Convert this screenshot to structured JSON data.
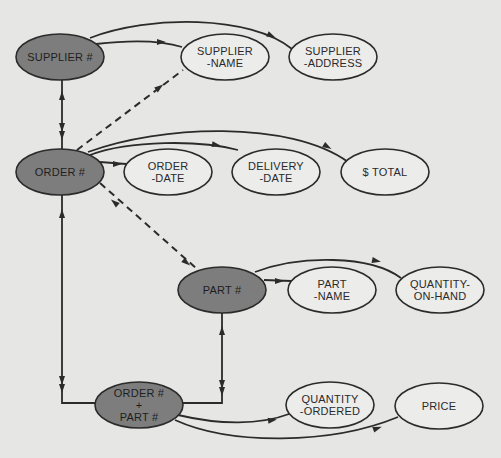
{
  "diagram": {
    "type": "functional-dependency-graph",
    "colors": {
      "background": "#e6e6e4",
      "key_node_fill": "#7d7d7d",
      "attribute_node_fill": "#ececea",
      "stroke": "#2b2b2b"
    },
    "nodes": [
      {
        "id": "supplier_no",
        "kind": "key",
        "lines": [
          "SUPPLIER #"
        ],
        "cx": 60,
        "cy": 57
      },
      {
        "id": "supplier_name",
        "kind": "attribute",
        "lines": [
          "SUPPLIER",
          "-NAME"
        ],
        "cx": 225,
        "cy": 57
      },
      {
        "id": "supplier_address",
        "kind": "attribute",
        "lines": [
          "SUPPLIER",
          "-ADDRESS"
        ],
        "cx": 333,
        "cy": 57
      },
      {
        "id": "order_no",
        "kind": "key",
        "lines": [
          "ORDER #"
        ],
        "cx": 60,
        "cy": 172
      },
      {
        "id": "order_date",
        "kind": "attribute",
        "lines": [
          "ORDER",
          "-DATE"
        ],
        "cx": 168,
        "cy": 172
      },
      {
        "id": "delivery_date",
        "kind": "attribute",
        "lines": [
          "DELIVERY",
          "-DATE"
        ],
        "cx": 276,
        "cy": 172
      },
      {
        "id": "total",
        "kind": "attribute",
        "lines": [
          "$ TOTAL"
        ],
        "cx": 385,
        "cy": 172
      },
      {
        "id": "part_no",
        "kind": "key",
        "lines": [
          "PART #"
        ],
        "cx": 222,
        "cy": 290
      },
      {
        "id": "part_name",
        "kind": "attribute",
        "lines": [
          "PART",
          "-NAME"
        ],
        "cx": 332,
        "cy": 290
      },
      {
        "id": "quantity_on_hand",
        "kind": "attribute",
        "lines": [
          "QUANTITY-",
          "ON-HAND"
        ],
        "cx": 440,
        "cy": 290
      },
      {
        "id": "order_part",
        "kind": "key",
        "lines": [
          "ORDER #",
          "+",
          "PART #"
        ],
        "cx": 139,
        "cy": 405
      },
      {
        "id": "quantity_ordered",
        "kind": "attribute",
        "lines": [
          "QUANTITY",
          "-ORDERED"
        ],
        "cx": 330,
        "cy": 405
      },
      {
        "id": "price",
        "kind": "attribute",
        "lines": [
          "PRICE"
        ],
        "cx": 439,
        "cy": 406
      }
    ],
    "edges": [
      {
        "from": "supplier_no",
        "to": "supplier_name",
        "style": "solid"
      },
      {
        "from": "supplier_no",
        "to": "supplier_address",
        "style": "solid"
      },
      {
        "from": "supplier_no",
        "to": "order_no",
        "style": "solid",
        "bidirectional": true
      },
      {
        "from": "order_no",
        "to": "supplier_name",
        "style": "dashed"
      },
      {
        "from": "order_no",
        "to": "order_date",
        "style": "solid"
      },
      {
        "from": "order_no",
        "to": "delivery_date",
        "style": "solid"
      },
      {
        "from": "order_no",
        "to": "total",
        "style": "solid"
      },
      {
        "from": "order_no",
        "to": "part_no",
        "style": "dashed",
        "bidirectional": true
      },
      {
        "from": "part_no",
        "to": "part_name",
        "style": "solid"
      },
      {
        "from": "part_no",
        "to": "quantity_on_hand",
        "style": "solid"
      },
      {
        "from": "order_part",
        "to": "order_no",
        "style": "solid",
        "bidirectional": true
      },
      {
        "from": "order_part",
        "to": "part_no",
        "style": "solid",
        "bidirectional": true
      },
      {
        "from": "order_part",
        "to": "quantity_ordered",
        "style": "solid"
      },
      {
        "from": "order_part",
        "to": "price",
        "style": "solid"
      }
    ]
  }
}
